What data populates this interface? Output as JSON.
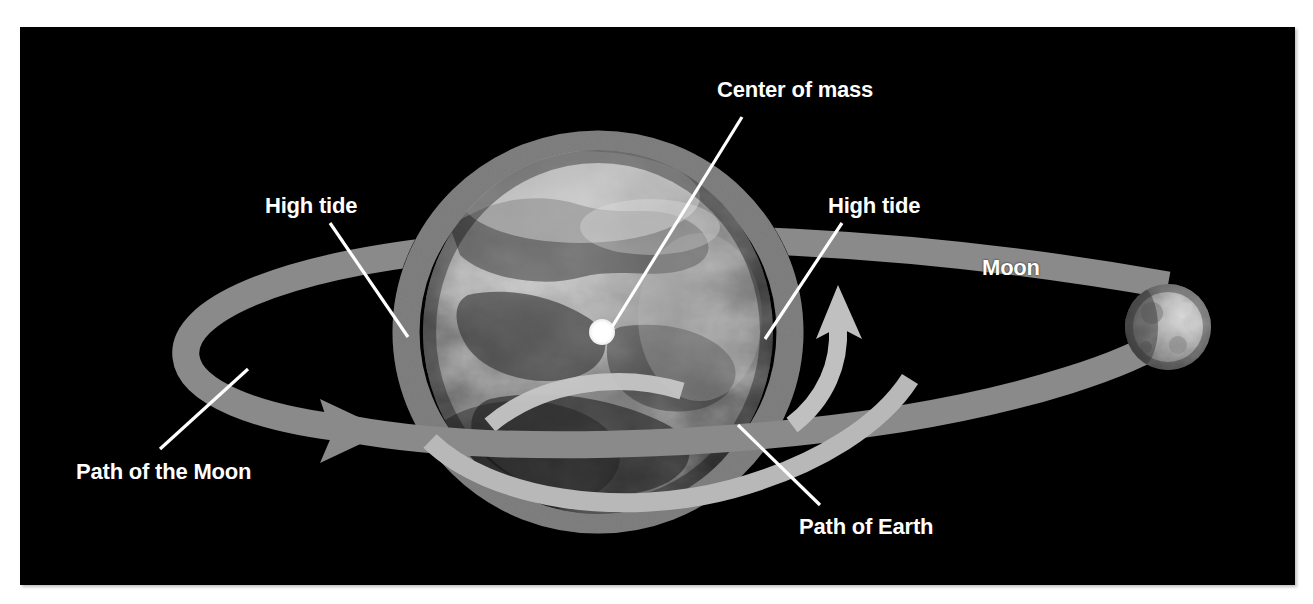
{
  "figure": {
    "domain": "Diagram",
    "background_color": "#ffffff",
    "panel_color": "#000000"
  },
  "panel": {
    "x": 20,
    "y": 27,
    "width": 1275,
    "height": 558
  },
  "labels": {
    "center_of_mass": "Center of mass",
    "high_tide_left": "High tide",
    "high_tide_right": "High tide",
    "moon": "Moon",
    "path_of_the_moon": "Path of the Moon",
    "path_of_earth": "Path of Earth"
  },
  "colors": {
    "label_text": "#ffffff",
    "leader_line": "#ffffff",
    "space_background": "#000000",
    "tidal_envelope": "#808080",
    "moon_orbit_band": "#8a8a8a",
    "earth_path_band": "#b8b8b8",
    "earth_path_arrow": "#c0c0c0",
    "center_of_mass_dot": "#ffffff",
    "moon_body_light": "#d8d8d8",
    "moon_body_dark": "#6a6a6a",
    "earth_body_light": "#cfcfcf",
    "earth_body_dark": "#262626"
  },
  "elements": {
    "earth": {
      "name": "Earth",
      "center_x": 578,
      "center_y": 305,
      "radius_x": 175,
      "radius_y": 182,
      "description": "Grayscale globe with continents and cloud texture, brighter toward upper area"
    },
    "tidal_envelope": {
      "name": "Tidal bulge envelope",
      "center_x": 578,
      "center_y": 305,
      "radius_x": 205,
      "radius_y": 200,
      "ring_thickness": 26,
      "description": "Gray ellipse ring surrounding Earth, bulging left and right toward and away from the Moon"
    },
    "moon": {
      "name": "Moon",
      "center_x": 1148,
      "center_y": 300,
      "radius": 43,
      "description": "Cratered gray sphere lit from the right, at the right end of the orbital band"
    },
    "center_of_mass_dot": {
      "name": "Center of mass marker",
      "center_x": 582,
      "center_y": 305,
      "radius": 13,
      "description": "White filled circle inside Earth, offset slightly toward the Moon"
    },
    "moon_orbit_band": {
      "name": "Path of the Moon band",
      "description": "Medium-gray elliptical band looping around the system, wrapping behind Earth at left with an arrowhead pointing right to show direction of travel"
    },
    "earth_path_band": {
      "name": "Path of Earth band",
      "description": "Lighter gray band crossing in front of Earth's lower half with a curved upward arrow on the right side"
    }
  },
  "leader_lines": [
    {
      "name": "center-of-mass-leader",
      "x1": 722,
      "y1": 90,
      "x2": 592,
      "y2": 300
    },
    {
      "name": "high-tide-left-leader",
      "x1": 310,
      "y1": 196,
      "x2": 388,
      "y2": 310
    },
    {
      "name": "high-tide-right-leader",
      "x1": 822,
      "y1": 196,
      "x2": 745,
      "y2": 312
    },
    {
      "name": "path-of-the-moon-leader",
      "x1": 140,
      "y1": 422,
      "x2": 228,
      "y2": 342
    },
    {
      "name": "path-of-earth-leader",
      "x1": 800,
      "y1": 478,
      "x2": 718,
      "y2": 398
    }
  ]
}
